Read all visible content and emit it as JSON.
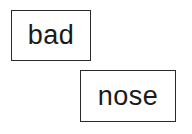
{
  "boxes": [
    {
      "label": "bad"
    },
    {
      "label": "nose"
    }
  ],
  "colors": {
    "border": "#2a2a2a",
    "text": "#1a1a1a",
    "background": "#ffffff"
  }
}
